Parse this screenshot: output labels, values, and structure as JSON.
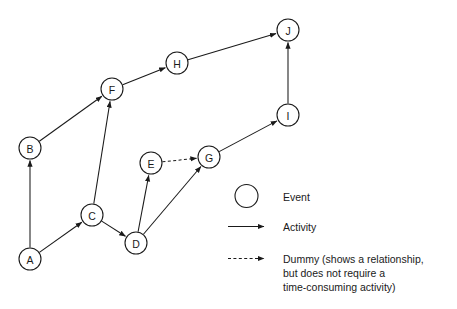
{
  "diagram": {
    "type": "network-activity-on-arrow",
    "nodes": [
      {
        "id": "A",
        "label": "A",
        "x": 30,
        "y": 259,
        "r": 11
      },
      {
        "id": "B",
        "label": "B",
        "x": 30,
        "y": 148,
        "r": 11
      },
      {
        "id": "C",
        "label": "C",
        "x": 92,
        "y": 215,
        "r": 11
      },
      {
        "id": "D",
        "label": "D",
        "x": 136,
        "y": 243,
        "r": 11
      },
      {
        "id": "E",
        "label": "E",
        "x": 151,
        "y": 163,
        "r": 11
      },
      {
        "id": "F",
        "label": "F",
        "x": 112,
        "y": 89,
        "r": 11
      },
      {
        "id": "G",
        "label": "G",
        "x": 209,
        "y": 157,
        "r": 11
      },
      {
        "id": "H",
        "label": "H",
        "x": 177,
        "y": 63,
        "r": 11
      },
      {
        "id": "I",
        "label": "I",
        "x": 288,
        "y": 115,
        "r": 11
      },
      {
        "id": "J",
        "label": "J",
        "x": 288,
        "y": 30,
        "r": 11
      }
    ],
    "edges": [
      {
        "from": "A",
        "to": "B",
        "kind": "activity"
      },
      {
        "from": "A",
        "to": "C",
        "kind": "activity"
      },
      {
        "from": "B",
        "to": "F",
        "kind": "activity"
      },
      {
        "from": "C",
        "to": "F",
        "kind": "activity"
      },
      {
        "from": "C",
        "to": "D",
        "kind": "activity"
      },
      {
        "from": "D",
        "to": "E",
        "kind": "activity"
      },
      {
        "from": "D",
        "to": "G",
        "kind": "activity"
      },
      {
        "from": "E",
        "to": "G",
        "kind": "dummy"
      },
      {
        "from": "F",
        "to": "H",
        "kind": "activity"
      },
      {
        "from": "G",
        "to": "I",
        "kind": "activity"
      },
      {
        "from": "H",
        "to": "J",
        "kind": "activity"
      },
      {
        "from": "I",
        "to": "J",
        "kind": "activity"
      }
    ]
  },
  "legend": {
    "items": [
      {
        "key": "event",
        "symbol": "circle",
        "label": "Event"
      },
      {
        "key": "activity",
        "symbol": "solid-arrow",
        "label": "Activity"
      },
      {
        "key": "dummy",
        "symbol": "dashed-arrow",
        "label": "Dummy (shows a relationship,",
        "label_line2": "but does not require a",
        "label_line3": "time-consuming activity)"
      }
    ]
  },
  "colors": {
    "stroke": "#1a1a1a",
    "fill": "#ffffff",
    "text": "#1a1a1a"
  }
}
